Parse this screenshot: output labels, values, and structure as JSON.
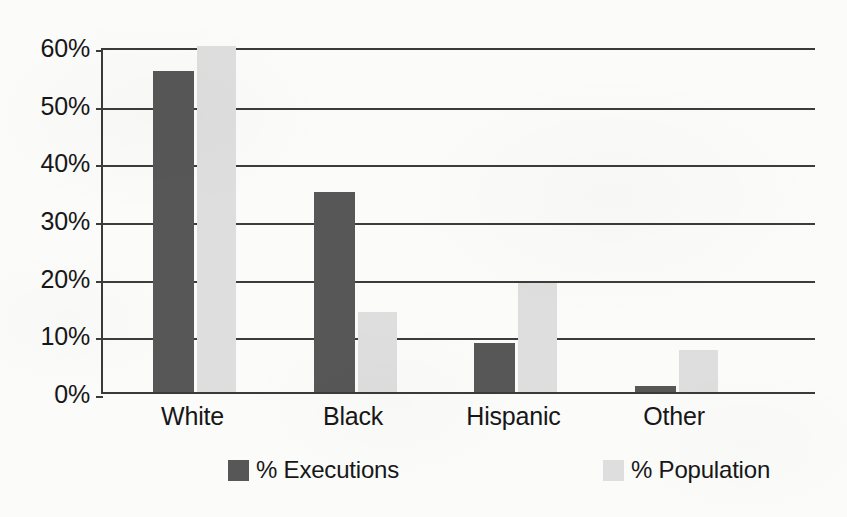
{
  "chart_data": {
    "type": "bar",
    "title": "",
    "subtitle": "",
    "xlabel": "",
    "ylabel": "",
    "categories": [
      "White",
      "Black",
      "Hispanic",
      "Other"
    ],
    "series": [
      {
        "name": "% Executions",
        "color": "#575757",
        "values": [
          55.6,
          34.6,
          8.5,
          1.1
        ]
      },
      {
        "name": "% Population",
        "color": "#dedede",
        "values": [
          60.0,
          13.9,
          18.9,
          7.3
        ]
      }
    ],
    "ylim": [
      0,
      60
    ],
    "ytick_values": [
      0,
      10,
      20,
      30,
      40,
      50,
      60
    ],
    "ytick_labels": [
      "0%",
      "10%",
      "20%",
      "30%",
      "40%",
      "50%",
      "60%"
    ],
    "grid": true,
    "grid_axis": "y",
    "legend_position": "bottom",
    "annotations": []
  },
  "colors": {
    "background": "#fbfbfa",
    "axis": "#3a3a3a",
    "gridline": "#3c3c3c",
    "text": "#171717",
    "series_executions": "#575757",
    "series_population": "#dedede"
  }
}
